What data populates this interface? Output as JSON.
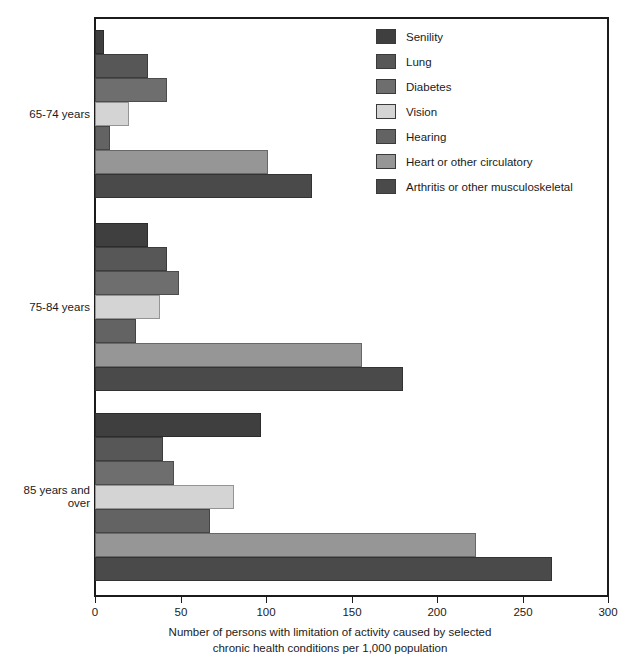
{
  "chart_data": {
    "type": "bar",
    "orientation": "horizontal",
    "title": "",
    "xlabel_line1": "Number of persons with limitation of activity caused by selected",
    "xlabel_line2": "chronic health conditions per 1,000 population",
    "ylabel": "",
    "xlim": [
      0,
      300
    ],
    "xticks": [
      0,
      50,
      100,
      150,
      200,
      250,
      300
    ],
    "xticklabels": [
      "0",
      "50",
      "100",
      "150",
      "200",
      "250",
      "300"
    ],
    "grid": false,
    "legend_position": "upper right",
    "categories": [
      "65-74 years",
      "75-84 years",
      "85 years and\nover"
    ],
    "series": [
      {
        "name": "Senility",
        "color": "#3f3f3f",
        "values": [
          5,
          31,
          97
        ]
      },
      {
        "name": "Lung",
        "color": "#575757",
        "values": [
          31,
          42,
          40
        ]
      },
      {
        "name": "Diabetes",
        "color": "#6e6e6e",
        "values": [
          42,
          49,
          46
        ]
      },
      {
        "name": "Vision",
        "color": "#d4d4d4",
        "values": [
          20,
          38,
          81
        ]
      },
      {
        "name": "Hearing",
        "color": "#636363",
        "values": [
          9,
          24,
          67
        ]
      },
      {
        "name": "Heart or other circulatory",
        "color": "#969696",
        "values": [
          101,
          156,
          223
        ]
      },
      {
        "name": "Arthritis or other musculoskeletal",
        "color": "#4a4a4a",
        "values": [
          127,
          180,
          267
        ]
      }
    ]
  },
  "legend": {
    "items": [
      {
        "label": "Senility"
      },
      {
        "label": "Lung"
      },
      {
        "label": "Diabetes"
      },
      {
        "label": "Vision"
      },
      {
        "label": "Hearing"
      },
      {
        "label": "Heart or other circulatory"
      },
      {
        "label": "Arthritis or other musculoskeletal"
      }
    ]
  }
}
